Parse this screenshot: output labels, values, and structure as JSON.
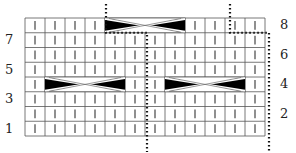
{
  "chart": {
    "type": "knitting-cable-chart",
    "columns": 12,
    "rows": 8,
    "grid": {
      "left": 25,
      "top": 18,
      "cell_w": 20,
      "cell_h": 14.75
    },
    "left_row_labels": [
      {
        "text": "7",
        "row": 7
      },
      {
        "text": "5",
        "row": 5
      },
      {
        "text": "3",
        "row": 3
      },
      {
        "text": "1",
        "row": 1
      }
    ],
    "right_row_labels": [
      {
        "text": "8",
        "row": 8
      },
      {
        "text": "6",
        "row": 6
      },
      {
        "text": "4",
        "row": 4
      },
      {
        "text": "2",
        "row": 2
      }
    ],
    "stitch_symbol": "knit-vertical-bar",
    "cables": [
      {
        "row": 8,
        "start_col": 5,
        "width": 4
      },
      {
        "row": 4,
        "start_col": 2,
        "width": 4
      },
      {
        "row": 4,
        "start_col": 8,
        "width": 4
      }
    ],
    "colors": {
      "grid": "#555555",
      "stitch": "#333333",
      "cable": "#000000",
      "dots": "#111111"
    }
  }
}
